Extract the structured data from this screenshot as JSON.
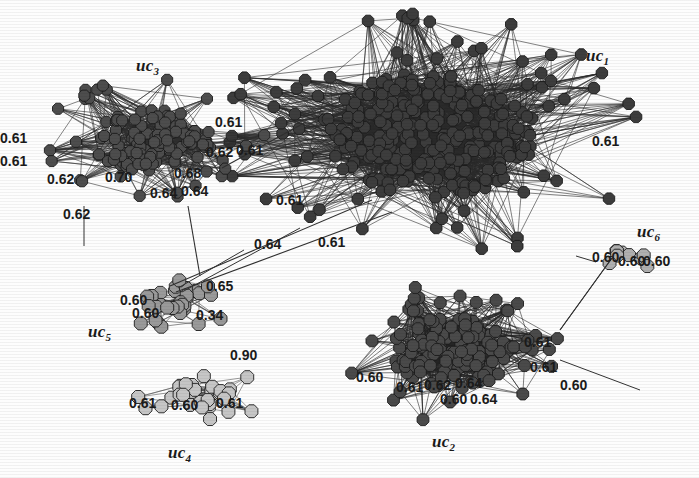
{
  "figure": {
    "type": "network-graph",
    "background_color": "#fdfdfd",
    "width": 699,
    "height": 478
  },
  "clusters": [
    {
      "id": "uc1",
      "label": "uc",
      "subscript": "1",
      "x": 586,
      "y": 46,
      "node_color": "#3d3d3d",
      "edge_color": "#2a2a2a",
      "cx": 430,
      "cy": 135,
      "rx": 150,
      "ry": 88,
      "core_count": 260,
      "halo_count": 62,
      "node_r": 6.2,
      "density": 0.92
    },
    {
      "id": "uc2",
      "label": "uc",
      "subscript": "2",
      "x": 432,
      "y": 432,
      "node_color": "#4a4a4a",
      "edge_color": "#262626",
      "cx": 452,
      "cy": 352,
      "rx": 86,
      "ry": 52,
      "core_count": 120,
      "halo_count": 30,
      "node_r": 6.4,
      "density": 0.88
    },
    {
      "id": "uc3",
      "label": "uc",
      "subscript": "3",
      "x": 136,
      "y": 56,
      "node_color": "#4d4d4d",
      "edge_color": "#2e2e2e",
      "cx": 150,
      "cy": 140,
      "rx": 84,
      "ry": 44,
      "core_count": 110,
      "halo_count": 26,
      "node_r": 6.0,
      "density": 0.85
    },
    {
      "id": "uc4",
      "label": "uc",
      "subscript": "4",
      "x": 168,
      "y": 443,
      "node_color": "#c6c6c6",
      "edge_color": "#555555",
      "cx": 205,
      "cy": 394,
      "rx": 50,
      "ry": 20,
      "core_count": 26,
      "halo_count": 8,
      "node_r": 7.0,
      "density": 0.42
    },
    {
      "id": "uc5",
      "label": "uc",
      "subscript": "5",
      "x": 88,
      "y": 322,
      "node_color": "#9a9a9a",
      "edge_color": "#4a4a4a",
      "cx": 178,
      "cy": 300,
      "rx": 48,
      "ry": 22,
      "core_count": 24,
      "halo_count": 8,
      "node_r": 7.0,
      "density": 0.45
    },
    {
      "id": "uc6",
      "label": "uc",
      "subscript": "6",
      "x": 637,
      "y": 222,
      "node_color": "#b0b0b0",
      "edge_color": "#4a4a4a",
      "cx": 632,
      "cy": 252,
      "rx": 26,
      "ry": 12,
      "core_count": 7,
      "halo_count": 2,
      "node_r": 7.0,
      "density": 0.6
    }
  ],
  "edge_labels": [
    {
      "text": "0.62",
      "x": 63,
      "y": 219
    },
    {
      "text": "0.62",
      "x": 47,
      "y": 184
    },
    {
      "text": "0.70",
      "x": 105,
      "y": 182
    },
    {
      "text": "0.64",
      "x": 150,
      "y": 198
    },
    {
      "text": "0.64",
      "x": 181,
      "y": 196
    },
    {
      "text": "0.68",
      "x": 174,
      "y": 178
    },
    {
      "text": "0.61",
      "x": 215,
      "y": 127
    },
    {
      "text": "0.62",
      "x": 206,
      "y": 157
    },
    {
      "text": "0.61",
      "x": 236,
      "y": 155
    },
    {
      "text": "0.61",
      "x": 0,
      "y": 143
    },
    {
      "text": "0.61",
      "x": 0,
      "y": 166
    },
    {
      "text": "0.61",
      "x": 276,
      "y": 205
    },
    {
      "text": "0.64",
      "x": 254,
      "y": 249
    },
    {
      "text": "0.61",
      "x": 318,
      "y": 247
    },
    {
      "text": "0.61",
      "x": 592,
      "y": 146
    },
    {
      "text": "0.60",
      "x": 592,
      "y": 262
    },
    {
      "text": "0.60",
      "x": 618,
      "y": 266
    },
    {
      "text": "0.60",
      "x": 643,
      "y": 266
    },
    {
      "text": "0.60",
      "x": 120,
      "y": 305
    },
    {
      "text": "0.65",
      "x": 206,
      "y": 291
    },
    {
      "text": "0.60",
      "x": 132,
      "y": 318
    },
    {
      "text": "0.34",
      "x": 196,
      "y": 320
    },
    {
      "text": "0.61",
      "x": 129,
      "y": 408
    },
    {
      "text": "0.60",
      "x": 171,
      "y": 410
    },
    {
      "text": "0.61",
      "x": 216,
      "y": 408
    },
    {
      "text": "0.90",
      "x": 230,
      "y": 360
    },
    {
      "text": "0.61",
      "x": 524,
      "y": 347
    },
    {
      "text": "0.61",
      "x": 530,
      "y": 372
    },
    {
      "text": "0.60",
      "x": 560,
      "y": 390
    },
    {
      "text": "0.61",
      "x": 396,
      "y": 392
    },
    {
      "text": "0.62",
      "x": 424,
      "y": 390
    },
    {
      "text": "0.64",
      "x": 455,
      "y": 388
    },
    {
      "text": "0.60",
      "x": 440,
      "y": 404
    },
    {
      "text": "0.64",
      "x": 470,
      "y": 404
    },
    {
      "text": "0.60",
      "x": 356,
      "y": 382
    }
  ],
  "bridges": [
    {
      "from": "uc3",
      "to": "uc1",
      "x1": 222,
      "y1": 168,
      "x2": 306,
      "y2": 122,
      "label": "0.61"
    },
    {
      "from": "uc5",
      "to": "uc1",
      "x1": 170,
      "y1": 286,
      "x2": 372,
      "y2": 200,
      "label": "0.64"
    },
    {
      "from": "uc5",
      "to": "uc1",
      "x1": 176,
      "y1": 292,
      "x2": 392,
      "y2": 212,
      "label": "0.61"
    },
    {
      "from": "uc3",
      "to": "uc5",
      "x1": 188,
      "y1": 206,
      "x2": 200,
      "y2": 276,
      "label": ""
    },
    {
      "from": "uc2",
      "to": "uc6",
      "x1": 560,
      "y1": 330,
      "x2": 612,
      "y2": 258,
      "label": ""
    }
  ],
  "chart_data": {
    "type": "scatter",
    "title": "",
    "series": [
      {
        "name": "uc1",
        "node_count": 322,
        "shade": "#3d3d3d"
      },
      {
        "name": "uc2",
        "node_count": 150,
        "shade": "#4a4a4a"
      },
      {
        "name": "uc3",
        "node_count": 136,
        "shade": "#4d4d4d"
      },
      {
        "name": "uc4",
        "node_count": 34,
        "shade": "#c6c6c6"
      },
      {
        "name": "uc5",
        "node_count": 32,
        "shade": "#9a9a9a"
      },
      {
        "name": "uc6",
        "node_count": 9,
        "shade": "#b0b0b0"
      }
    ],
    "edge_weight_values": [
      0.34,
      0.6,
      0.61,
      0.62,
      0.64,
      0.65,
      0.68,
      0.7,
      0.9
    ],
    "xlabel": "",
    "ylabel": "",
    "legend": "none",
    "grid": false
  }
}
